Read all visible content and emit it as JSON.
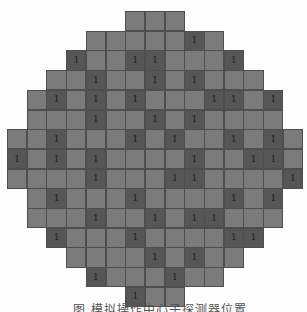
{
  "diagram": {
    "type": "wafer-grid-map",
    "grid": {
      "origin_x": 7,
      "origin_y": 11,
      "cell_size": 19.7,
      "columns": 15,
      "rows": 15
    },
    "colors": {
      "cell": "#7b7b7b",
      "marked_cell": "#565656",
      "border": "#4e4e4e",
      "label": "#1e1e1e"
    },
    "marked_label": "1",
    "rows": [
      {
        "start": 6,
        "end": 8,
        "marked": []
      },
      {
        "start": 4,
        "end": 10,
        "marked": [
          9
        ]
      },
      {
        "start": 3,
        "end": 11,
        "marked": [
          3,
          6,
          7,
          11
        ]
      },
      {
        "start": 2,
        "end": 12,
        "marked": [
          4,
          7,
          9
        ]
      },
      {
        "start": 1,
        "end": 13,
        "marked": [
          2,
          4,
          6,
          10,
          11,
          13
        ]
      },
      {
        "start": 1,
        "end": 13,
        "marked": [
          4,
          7,
          9
        ]
      },
      {
        "start": 0,
        "end": 14,
        "marked": [
          2,
          6,
          8,
          11,
          13
        ]
      },
      {
        "start": 0,
        "end": 14,
        "marked": [
          0,
          2,
          4,
          9,
          12,
          13
        ]
      },
      {
        "start": 0,
        "end": 14,
        "marked": [
          4,
          8,
          9,
          14
        ]
      },
      {
        "start": 1,
        "end": 13,
        "marked": [
          2,
          6,
          11,
          13
        ]
      },
      {
        "start": 1,
        "end": 13,
        "marked": [
          4,
          7,
          9,
          10
        ]
      },
      {
        "start": 2,
        "end": 12,
        "marked": [
          2,
          6,
          11,
          12
        ]
      },
      {
        "start": 3,
        "end": 11,
        "marked": [
          7,
          9
        ]
      },
      {
        "start": 4,
        "end": 10,
        "marked": [
          4,
          8
        ]
      },
      {
        "start": 6,
        "end": 8,
        "marked": [
          6
        ]
      }
    ]
  },
  "caption": "图          模拟操作中心子探测器位置"
}
